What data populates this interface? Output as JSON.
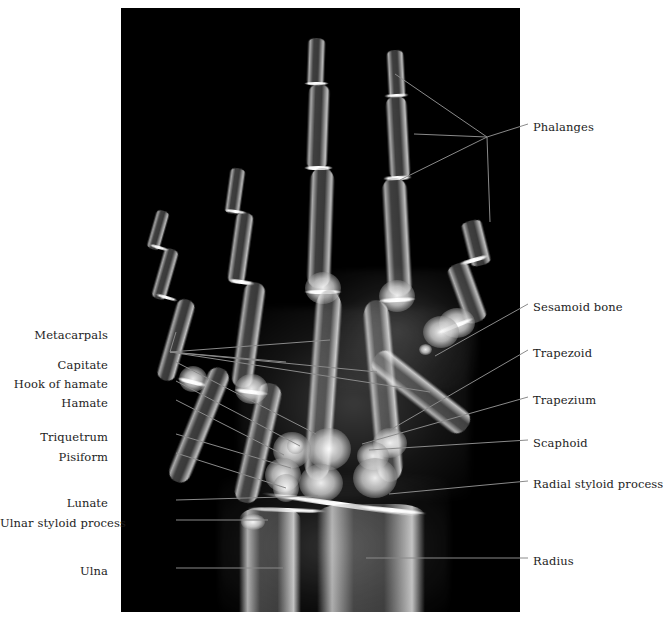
{
  "figure": {
    "type": "anatomical-radiograph",
    "caption": ""
  },
  "plate": {
    "background_color": "#000000",
    "bone_color": "#d8d8d8",
    "left": 121,
    "top": 8,
    "width": 399,
    "height": 604
  },
  "labels": {
    "left": [
      {
        "text": "Metacarpals",
        "x": 108,
        "y": 335
      },
      {
        "text": "Capitate",
        "x": 108,
        "y": 365
      },
      {
        "text": "Hook of hamate",
        "x": 108,
        "y": 384
      },
      {
        "text": "Hamate",
        "x": 108,
        "y": 403
      },
      {
        "text": "Triquetrum",
        "x": 108,
        "y": 437
      },
      {
        "text": "Pisiform",
        "x": 108,
        "y": 457
      },
      {
        "text": "Lunate",
        "x": 108,
        "y": 503
      },
      {
        "text": "Ulnar styloid process",
        "x": 108,
        "y": 523
      },
      {
        "text": "Ulna",
        "x": 108,
        "y": 571
      }
    ],
    "right": [
      {
        "text": "Phalanges",
        "x": 533,
        "y": 127
      },
      {
        "text": "Sesamoid bone",
        "x": 533,
        "y": 307
      },
      {
        "text": "Trapezoid",
        "x": 533,
        "y": 353
      },
      {
        "text": "Trapezium",
        "x": 533,
        "y": 400
      },
      {
        "text": "Scaphoid",
        "x": 533,
        "y": 443
      },
      {
        "text": "Radial styloid process",
        "x": 533,
        "y": 484
      },
      {
        "text": "Radius",
        "x": 533,
        "y": 561
      }
    ]
  },
  "leader_lines": {
    "color": "#8a8a8a",
    "width": 1,
    "paths": [
      "M176,332 L170,352",
      "M170,352 L330,340  M170,352 L286,362  M170,352 L377,372  M170,352 L430,392",
      "M176,362 L316,434",
      "M176,381 L300,446",
      "M176,400 L284,455",
      "M176,434 L291,468",
      "M176,453 L286,488",
      "M176,500 L318,496",
      "M176,520 L268,520",
      "M176,568 L283,568",
      "M528,124 L487,137",
      "M487,137 L395,74  M487,137 L414,134  M487,137 L400,180  M487,137 L490,222",
      "M528,304 L435,356",
      "M528,350 L390,430",
      "M528,397 L362,444",
      "M528,440 L369,450",
      "M528,481 L389,494",
      "M528,558 L366,558"
    ]
  }
}
